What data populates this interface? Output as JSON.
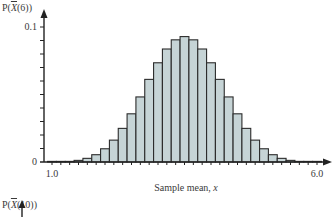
{
  "chart_data": {
    "type": "bar",
    "title": "",
    "ylabel": "P(X̄(6))",
    "ylabel_parts": {
      "prefix": "P(",
      "var": "X",
      "suffix": "(6))"
    },
    "xlabel": "Sample mean, x",
    "x_ticks_labeled": [
      "1.0",
      "6.0"
    ],
    "y_ticks_labeled": [
      "0",
      "0.1"
    ],
    "xlim": [
      1.0,
      6.0
    ],
    "ylim": [
      0,
      0.1
    ],
    "grid": false,
    "legend": null,
    "bar_color": "#c6d4d6",
    "edge_color": "#2b2b2b",
    "categories": [
      1.0,
      1.167,
      1.333,
      1.5,
      1.667,
      1.833,
      2.0,
      2.167,
      2.333,
      2.5,
      2.667,
      2.833,
      3.0,
      3.167,
      3.333,
      3.5,
      3.667,
      3.833,
      4.0,
      4.167,
      4.333,
      4.5,
      4.667,
      4.833,
      5.0,
      5.167,
      5.333,
      5.5,
      5.667,
      5.833,
      6.0
    ],
    "values": [
      2e-05,
      0.00013,
      0.00045,
      0.0012,
      0.0027,
      0.0054,
      0.0098,
      0.0162,
      0.0249,
      0.0357,
      0.0482,
      0.0612,
      0.0735,
      0.0837,
      0.0905,
      0.0929,
      0.0905,
      0.0837,
      0.0735,
      0.0612,
      0.0482,
      0.0357,
      0.0249,
      0.0162,
      0.0098,
      0.0054,
      0.0027,
      0.0012,
      0.00045,
      0.00013,
      2e-05
    ]
  },
  "next_chart": {
    "ylabel_parts": {
      "prefix": "P(",
      "var": "X",
      "suffix": "(10))"
    }
  }
}
